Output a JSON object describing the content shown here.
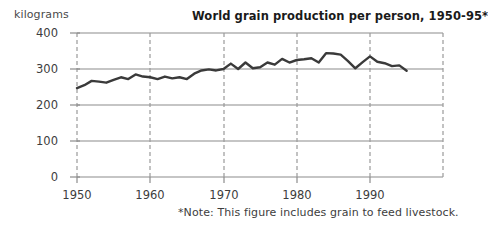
{
  "axis_unit_label": "kilograms",
  "title": "World grain production per person, 1950-95*",
  "footnote": "*Note: This figure includes grain to feed livestock.",
  "y_ticks": [
    "400",
    "300",
    "200",
    "100",
    "0"
  ],
  "x_ticks": [
    "1950",
    "1960",
    "1970",
    "1980",
    "1990"
  ],
  "colors": {
    "line": "#3a3a3a",
    "gridline": "#8c8c8c",
    "dashed_gridline": "#9a9a9a",
    "text": "#3d3d3d",
    "title": "#1a1a1a",
    "background": "#ffffff"
  },
  "chart_data": {
    "type": "line",
    "title": "World grain production per person, 1950-95*",
    "xlabel": "",
    "ylabel": "kilograms",
    "xlim": [
      1950,
      1995
    ],
    "ylim": [
      0,
      400
    ],
    "yticks": [
      0,
      100,
      200,
      300,
      400
    ],
    "xticks": [
      1950,
      1960,
      1970,
      1980,
      1990
    ],
    "grid": true,
    "legend": "none",
    "annotations": [
      "*Note: This figure includes grain to feed livestock."
    ],
    "x": [
      1950,
      1951,
      1952,
      1953,
      1954,
      1955,
      1956,
      1957,
      1958,
      1959,
      1960,
      1961,
      1962,
      1963,
      1964,
      1965,
      1966,
      1967,
      1968,
      1969,
      1970,
      1971,
      1972,
      1973,
      1974,
      1975,
      1976,
      1977,
      1978,
      1979,
      1980,
      1981,
      1982,
      1983,
      1984,
      1985,
      1986,
      1987,
      1988,
      1989,
      1990,
      1991,
      1992,
      1993,
      1994,
      1995
    ],
    "series": [
      {
        "name": "World grain production per person",
        "values": [
          247,
          255,
          267,
          265,
          262,
          270,
          277,
          272,
          285,
          279,
          277,
          272,
          279,
          274,
          277,
          272,
          287,
          296,
          299,
          296,
          300,
          315,
          300,
          318,
          302,
          305,
          318,
          312,
          328,
          318,
          325,
          327,
          330,
          318,
          344,
          343,
          340,
          322,
          302,
          319,
          335,
          320,
          316,
          308,
          310,
          295
        ]
      }
    ]
  }
}
